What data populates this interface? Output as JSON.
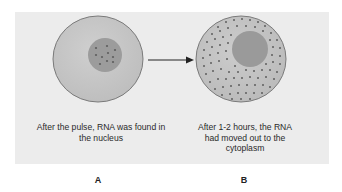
{
  "figure": {
    "panel_color": "#ececec",
    "cell_a": {
      "label": "A",
      "caption": "After the pulse, RNA was found in the nucleus",
      "description": "RNA dots concentrated inside the nucleus"
    },
    "cell_b": {
      "label": "B",
      "caption": "After 1-2 hours, the RNA had moved out to the cytoplasm",
      "description": "RNA dots dispersed throughout the cytoplasm"
    },
    "arrow": {
      "direction": "right"
    },
    "colors": {
      "cytoplasm": "#c4c4c4",
      "cell_outline": "#7a7a7a",
      "nucleus": "#9c9c9c",
      "rna_dot": "#5e5e5e"
    }
  }
}
